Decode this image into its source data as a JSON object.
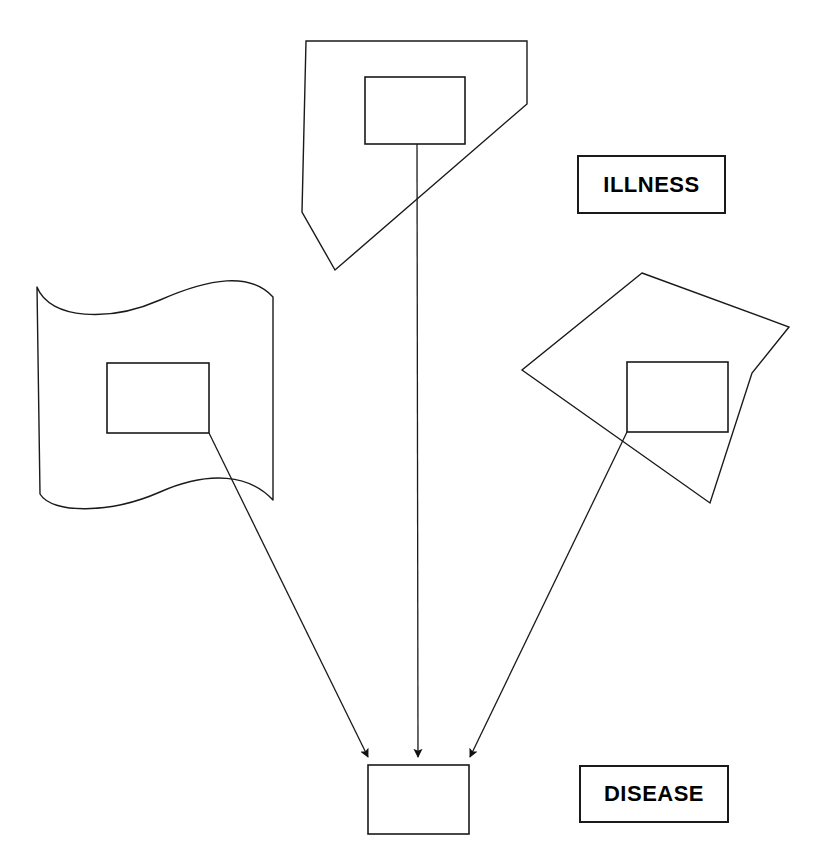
{
  "diagram": {
    "background_color": "#ffffff",
    "stroke_color": "#1a1a1a",
    "stroke_width": 1.4,
    "width": 824,
    "height": 860,
    "legend": {
      "illness": {
        "label": "ILLNESS",
        "shape": "rectangle",
        "x": 577,
        "y": 155,
        "width": 149,
        "height": 59
      },
      "disease": {
        "label": "DISEASE",
        "shape": "rectangle",
        "x": 579,
        "y": 765,
        "width": 150,
        "height": 58
      }
    },
    "illness_shapes": [
      {
        "name": "top-pentagon",
        "type": "polygon",
        "points": "306,41 527,41 527,104 335,270 302,212",
        "inner_rect": {
          "x": 365,
          "y": 77,
          "width": 100,
          "height": 67
        }
      },
      {
        "name": "left-flag",
        "type": "wave",
        "path": "M 37,287 C 50,320 110,322 160,300 C 210,278 250,272 273,297 L 273,500 C 250,475 210,470 160,492 C 110,514 52,514 40,494 Z",
        "inner_rect": {
          "x": 107,
          "y": 363,
          "width": 102,
          "height": 70
        }
      },
      {
        "name": "right-kite",
        "type": "polygon",
        "points": "642,273 789,327 752,373 710,503 522,370",
        "inner_rect": {
          "x": 627,
          "y": 362,
          "width": 101,
          "height": 70
        }
      }
    ],
    "disease_shape": {
      "name": "disease-rectangle",
      "type": "rectangle",
      "x": 368,
      "y": 765,
      "width": 101,
      "height": 69
    },
    "connectors": [
      {
        "name": "left-flag-to-disease",
        "from": "left-flag-inner-rect",
        "to": "disease-rectangle",
        "x1": 209,
        "y1": 433,
        "x2": 368,
        "y2": 763,
        "arrowhead": "end"
      },
      {
        "name": "top-pentagon-to-disease",
        "from": "top-pentagon-inner-rect",
        "to": "disease-rectangle",
        "x1": 417,
        "y1": 144,
        "x2": 418,
        "y2": 763,
        "arrowhead": "end"
      },
      {
        "name": "right-kite-to-disease",
        "from": "right-kite-inner-rect",
        "to": "disease-rectangle",
        "x1": 627,
        "y1": 432,
        "x2": 470,
        "y2": 763,
        "arrowhead": "end"
      }
    ]
  }
}
